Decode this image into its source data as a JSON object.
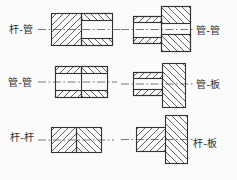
{
  "figure": {
    "background": "#fbfbfb",
    "line_color": "#333333",
    "panels": [
      {
        "id": "rod-tube",
        "label": "杆-管",
        "position": "top-left",
        "left_part": "rod",
        "right_part": "tube"
      },
      {
        "id": "tube-tube",
        "label": "管-管",
        "position": "middle-left",
        "left_part": "tube",
        "right_part": "tube"
      },
      {
        "id": "rod-rod",
        "label": "杆-杆",
        "position": "bottom-left",
        "left_part": "rod",
        "right_part": "rod"
      },
      {
        "id": "tube-tube-stepped",
        "label": "管-管",
        "position": "top-right",
        "left_part": "tube",
        "right_part": "tube"
      },
      {
        "id": "tube-plate",
        "label": "管-板",
        "position": "middle-right",
        "left_part": "tube",
        "right_part": "plate"
      },
      {
        "id": "rod-plate",
        "label": "杆-板",
        "position": "bottom-right",
        "left_part": "rod",
        "right_part": "plate"
      }
    ]
  }
}
